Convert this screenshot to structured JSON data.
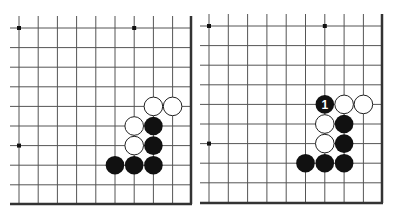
{
  "colors": {
    "line": "#555555",
    "black": "#111111",
    "white": "#ffffff"
  },
  "boards": [
    {
      "name": "left-board",
      "origin": [
        19,
        28
      ],
      "step": [
        19.2,
        19.6
      ],
      "line_start": [
        10,
        16
      ],
      "cols": 9,
      "rows": 9,
      "right_edge": 191,
      "bottom_edge": 204,
      "star_points": [
        [
          0,
          0
        ],
        [
          6,
          0
        ],
        [
          0,
          6
        ]
      ],
      "stones": [
        {
          "c": 7,
          "r": 4,
          "color": "white"
        },
        {
          "c": 8,
          "r": 4,
          "color": "white"
        },
        {
          "c": 6,
          "r": 5,
          "color": "white"
        },
        {
          "c": 7,
          "r": 5,
          "color": "black"
        },
        {
          "c": 6,
          "r": 6,
          "color": "white"
        },
        {
          "c": 7,
          "r": 6,
          "color": "black"
        },
        {
          "c": 5,
          "r": 7,
          "color": "black"
        },
        {
          "c": 6,
          "r": 7,
          "color": "black"
        },
        {
          "c": 7,
          "r": 7,
          "color": "black"
        }
      ]
    },
    {
      "name": "right-board",
      "origin": [
        209,
        26
      ],
      "step": [
        19.3,
        19.6
      ],
      "line_start": [
        200,
        14
      ],
      "cols": 9,
      "rows": 9,
      "right_edge": 382,
      "bottom_edge": 203,
      "star_points": [
        [
          0,
          0
        ],
        [
          6,
          0
        ],
        [
          0,
          6
        ]
      ],
      "stones": [
        {
          "c": 6,
          "r": 4,
          "color": "black",
          "label": "1"
        },
        {
          "c": 7,
          "r": 4,
          "color": "white"
        },
        {
          "c": 8,
          "r": 4,
          "color": "white"
        },
        {
          "c": 6,
          "r": 5,
          "color": "white"
        },
        {
          "c": 7,
          "r": 5,
          "color": "black"
        },
        {
          "c": 6,
          "r": 6,
          "color": "white"
        },
        {
          "c": 7,
          "r": 6,
          "color": "black"
        },
        {
          "c": 5,
          "r": 7,
          "color": "black"
        },
        {
          "c": 6,
          "r": 7,
          "color": "black"
        },
        {
          "c": 7,
          "r": 7,
          "color": "black"
        }
      ]
    }
  ]
}
